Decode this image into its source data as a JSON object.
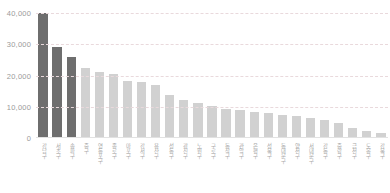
{
  "chart_data": {
    "type": "bar",
    "title": "",
    "xlabel": "",
    "ylabel": "",
    "ylim": [
      0,
      40000
    ],
    "yticks": [
      "0",
      "10,000",
      "20,000",
      "30,000",
      "40,000"
    ],
    "ytick_values": [
      0,
      10000,
      20000,
      30000,
      40000
    ],
    "grid": true,
    "legend": "none",
    "categories": [
      "강남구",
      "서초구",
      "송파구",
      "중구",
      "영등포구",
      "종로구",
      "마포구",
      "강서구",
      "용산구",
      "성동구",
      "광진구",
      "노원구",
      "구로구",
      "동작구",
      "관악구",
      "은평구",
      "성북구",
      "동대문구",
      "양천구",
      "서대문구",
      "강동구",
      "중랑구",
      "금천구",
      "도봉구",
      "강북구"
    ],
    "values": [
      40000,
      29000,
      26000,
      22300,
      21200,
      20400,
      18200,
      17900,
      16900,
      13900,
      12200,
      11100,
      10200,
      9400,
      8900,
      8400,
      7900,
      7500,
      7100,
      6400,
      5700,
      4700,
      3200,
      2100,
      1500
    ],
    "bar_colors": [
      "#6e6e6e",
      "#6e6e6e",
      "#6e6e6e",
      "#d1d1d1",
      "#d1d1d1",
      "#d1d1d1",
      "#d1d1d1",
      "#d1d1d1",
      "#d1d1d1",
      "#d1d1d1",
      "#d1d1d1",
      "#d1d1d1",
      "#d1d1d1",
      "#d1d1d1",
      "#d1d1d1",
      "#d1d1d1",
      "#d1d1d1",
      "#d1d1d1",
      "#d1d1d1",
      "#d1d1d1",
      "#d1d1d1",
      "#d1d1d1",
      "#d1d1d1",
      "#d1d1d1",
      "#d1d1d1"
    ],
    "colors": {
      "highlight_bar": "#6e6e6e",
      "default_bar": "#d1d1d1",
      "gridline": "#e9d9dc",
      "axis_text": "#9a9a9a",
      "label_text": "#a8a8a8",
      "background": "#ffffff"
    }
  }
}
